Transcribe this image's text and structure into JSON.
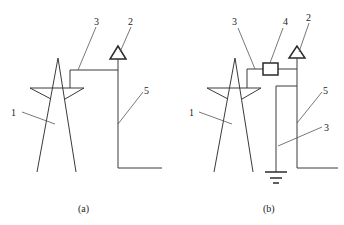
{
  "diagram": {
    "panels": [
      {
        "id": "a",
        "caption": "(a)",
        "labels": {
          "tower": "1",
          "air_terminal": "2",
          "connector": "3",
          "down_conductor": "5"
        }
      },
      {
        "id": "b",
        "caption": "(b)",
        "labels": {
          "tower": "1",
          "air_terminal": "2",
          "connector": "3",
          "device": "4",
          "down_conductor": "5",
          "ground_lead": "3"
        }
      }
    ],
    "colors": {
      "line": "#3a3a3a",
      "background": "#ffffff"
    }
  }
}
